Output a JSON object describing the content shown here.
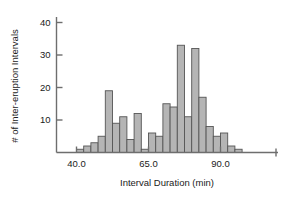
{
  "chart_data": {
    "type": "bar",
    "title": "",
    "subtitle": "",
    "xlabel": "Interval Duration (min)",
    "ylabel": "# of Inter-eruption Intervals",
    "xlim": [
      36.5,
      100.0
    ],
    "ylim": [
      0,
      43
    ],
    "xticks": [
      40.0,
      65.0,
      90.0
    ],
    "xtick_labels": [
      "40.0",
      "65.0",
      "90.0"
    ],
    "yticks": [
      10,
      20,
      30,
      40
    ],
    "ytick_labels": [
      "10",
      "20",
      "30",
      "40"
    ],
    "grid": false,
    "legend": null,
    "bin_width": 2.5,
    "bar_color": "#b5b5b5",
    "bar_edge_color": "#555555",
    "axis_color": "#6e6e6e",
    "bins": [
      {
        "x0": 40.0,
        "x1": 42.5,
        "value": 1
      },
      {
        "x0": 42.5,
        "x1": 45.0,
        "value": 2
      },
      {
        "x0": 45.0,
        "x1": 47.5,
        "value": 3
      },
      {
        "x0": 47.5,
        "x1": 50.0,
        "value": 5
      },
      {
        "x0": 50.0,
        "x1": 52.5,
        "value": 19
      },
      {
        "x0": 52.5,
        "x1": 55.0,
        "value": 9
      },
      {
        "x0": 55.0,
        "x1": 57.5,
        "value": 11
      },
      {
        "x0": 57.5,
        "x1": 60.0,
        "value": 4
      },
      {
        "x0": 60.0,
        "x1": 62.5,
        "value": 12
      },
      {
        "x0": 62.5,
        "x1": 65.0,
        "value": 1
      },
      {
        "x0": 65.0,
        "x1": 67.5,
        "value": 6
      },
      {
        "x0": 67.5,
        "x1": 70.0,
        "value": 5
      },
      {
        "x0": 70.0,
        "x1": 72.5,
        "value": 15
      },
      {
        "x0": 72.5,
        "x1": 75.0,
        "value": 14
      },
      {
        "x0": 75.0,
        "x1": 77.5,
        "value": 33
      },
      {
        "x0": 77.5,
        "x1": 80.0,
        "value": 11
      },
      {
        "x0": 80.0,
        "x1": 82.5,
        "value": 32
      },
      {
        "x0": 82.5,
        "x1": 85.0,
        "value": 17
      },
      {
        "x0": 85.0,
        "x1": 87.5,
        "value": 8
      },
      {
        "x0": 87.5,
        "x1": 90.0,
        "value": 5
      },
      {
        "x0": 90.0,
        "x1": 92.5,
        "value": 6
      },
      {
        "x0": 92.5,
        "x1": 95.0,
        "value": 2
      },
      {
        "x0": 95.0,
        "x1": 97.5,
        "value": 1
      }
    ]
  }
}
